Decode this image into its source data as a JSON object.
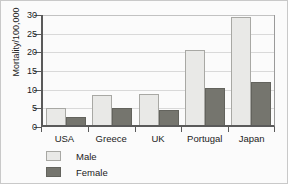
{
  "chart_data": {
    "type": "bar",
    "title": "",
    "xlabel": "",
    "ylabel": "Mortality/100,000",
    "ylim": [
      0,
      30
    ],
    "yticks": [
      0,
      5,
      10,
      15,
      20,
      25,
      30
    ],
    "grid": "horizontal",
    "legend_position": "below-axis-left",
    "categories": [
      "USA",
      "Greece",
      "UK",
      "Portugal",
      "Japan"
    ],
    "series": [
      {
        "name": "Male",
        "color": "#e9e9e7",
        "values": [
          4.5,
          8.0,
          8.2,
          20.0,
          29.0
        ]
      },
      {
        "name": "Female",
        "color": "#75756e",
        "values": [
          2.1,
          4.6,
          4.1,
          9.9,
          11.6
        ]
      }
    ]
  },
  "colors": {
    "male": "#e9e9e7",
    "female": "#75756e",
    "axis": "#5a5a5a",
    "grid": "#d9d9d9",
    "text": "#1c1c1c",
    "background": "#fbfbfb",
    "frame": "#c9c9c9"
  }
}
